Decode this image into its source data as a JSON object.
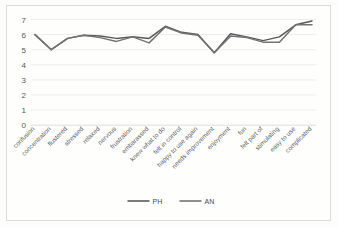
{
  "chart_data": {
    "type": "line",
    "title": "",
    "xlabel": "",
    "ylabel": "",
    "ylim": [
      0,
      7
    ],
    "yticks": [
      0,
      1,
      2,
      3,
      4,
      5,
      6,
      7
    ],
    "grid": true,
    "legend_position": "bottom",
    "categories": [
      "confusion",
      "concentration",
      "flustered",
      "stressed",
      "relaxed",
      "nervous",
      "frustration",
      "embarassed",
      "knew what to do",
      "felt in control",
      "happy to use again",
      "needs improvement",
      "enjoyment",
      "fun",
      "felt part of",
      "stimulating",
      "easy to use",
      "complicated"
    ],
    "series": [
      {
        "name": "PH",
        "color": "#5a5a5c",
        "values": [
          6.0,
          5.0,
          5.75,
          5.95,
          5.9,
          5.75,
          5.85,
          5.75,
          6.55,
          6.15,
          6.0,
          4.8,
          6.05,
          5.85,
          5.6,
          5.85,
          6.65,
          6.9
        ]
      },
      {
        "name": "AN",
        "color": "#737375",
        "values": [
          6.0,
          5.0,
          5.75,
          5.95,
          5.8,
          5.55,
          5.85,
          5.45,
          6.5,
          6.1,
          5.95,
          4.8,
          5.9,
          5.8,
          5.5,
          5.5,
          6.65,
          6.65
        ]
      }
    ]
  },
  "legend": {
    "entries": [
      {
        "label": "PH"
      },
      {
        "label": "AN"
      }
    ]
  },
  "axis": {
    "y_tick_labels": [
      "7",
      "6",
      "5",
      "4",
      "3",
      "2",
      "1",
      "0"
    ]
  }
}
